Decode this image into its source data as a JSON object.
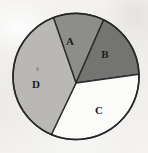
{
  "figure": {
    "kind": "pie-chart",
    "background_color": "#f2f1ef",
    "outline_color": "#2b2b2b",
    "canvas": {
      "width": 148,
      "height": 153
    },
    "circle": {
      "cx": 76,
      "cy": 76.5,
      "r": 63
    },
    "hub": {
      "x": 76,
      "y": 83
    }
  },
  "chart_data": {
    "type": "pie",
    "title": "",
    "subtitle": "",
    "xlabel": "",
    "ylabel": "",
    "grid": false,
    "legend_position": "none",
    "labels_inside": true,
    "categories": [
      "A",
      "B",
      "C",
      "D"
    ],
    "values": [
      13,
      17,
      32,
      38
    ],
    "unit": "percent",
    "total": 100,
    "start_angle_deg": -21,
    "direction": "clockwise",
    "slices": [
      {
        "label": "A",
        "value": 13,
        "percent": 13,
        "color": "#8d8d8a",
        "start_angle_deg": -21,
        "end_angle_deg": 26,
        "sweep_deg": 47,
        "label_x": 70,
        "label_y": 41,
        "edge_start": {
          "x": 44,
          "y": 22
        },
        "edge_end": {
          "x": 96,
          "y": 14
        }
      },
      {
        "label": "B",
        "value": 17,
        "percent": 17,
        "color": "#747472",
        "start_angle_deg": 26,
        "end_angle_deg": 88,
        "sweep_deg": 62,
        "label_x": 105,
        "label_y": 54,
        "edge_start": {
          "x": 96,
          "y": 14
        },
        "edge_end": {
          "x": 137,
          "y": 66
        }
      },
      {
        "label": "C",
        "value": 32,
        "percent": 32,
        "color": "#fbfbfa",
        "start_angle_deg": 88,
        "end_angle_deg": 203,
        "sweep_deg": 115,
        "label_x": 99,
        "label_y": 110,
        "edge_start": {
          "x": 137,
          "y": 66
        },
        "edge_end": {
          "x": 45,
          "y": 137
        }
      },
      {
        "label": "D",
        "value": 38,
        "percent": 38,
        "color": "#b9b8b4",
        "start_angle_deg": 203,
        "end_angle_deg": 339,
        "sweep_deg": 136,
        "label_x": 36,
        "label_y": 84,
        "edge_start": {
          "x": 45,
          "y": 137
        },
        "edge_end": {
          "x": 44,
          "y": 22
        }
      }
    ]
  }
}
